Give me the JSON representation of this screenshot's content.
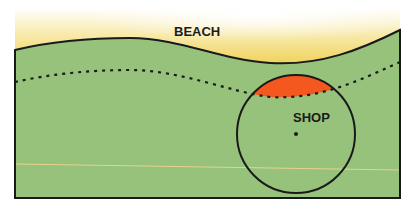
{
  "diagram": {
    "labels": {
      "beach": "BEACH",
      "shop": "SHOP"
    },
    "colors": {
      "beach_sand": "#f3d96a",
      "beach_fade": "#ffffff",
      "land_green": "#97c27c",
      "highlight_orange": "#f4581e",
      "outline": "#1a1a1a",
      "faint_line": "#e6d48a"
    }
  }
}
